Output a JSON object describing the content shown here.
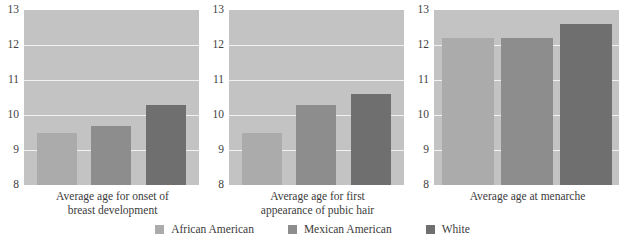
{
  "chart_data": {
    "type": "bar",
    "title": "",
    "subtitle": "",
    "xlabel": "",
    "ylabel": "",
    "ylim": [
      8,
      13
    ],
    "yticks": [
      8,
      9,
      10,
      11,
      12,
      13
    ],
    "ytick_labels": [
      "8",
      "9",
      "10",
      "11",
      "12",
      "13"
    ],
    "grid": true,
    "legend_position": "bottom-center",
    "categories": [
      "African American",
      "Mexican American",
      "White"
    ],
    "series": [
      {
        "name": "Average age for onset of breast development",
        "caption_lines": [
          "Average age for onset of",
          "breast development"
        ],
        "values": [
          9.5,
          9.7,
          10.3
        ]
      },
      {
        "name": "Average age for first appearance of pubic hair",
        "caption_lines": [
          "Average age for first",
          "appearance of pubic hair"
        ],
        "values": [
          9.5,
          10.3,
          10.6
        ]
      },
      {
        "name": "Average age at menarche",
        "caption_lines": [
          "Average age at menarche"
        ],
        "values": [
          12.2,
          12.2,
          12.6
        ]
      }
    ],
    "colors": {
      "african_american": "#ababab",
      "mexican_american": "#8d8d8d",
      "white": "#6f6f6f",
      "plot_background": "#c3c3c3",
      "gridline": "#f2f2f2",
      "page_background": "#ffffff",
      "text": "#3b3b3b"
    }
  },
  "legend": {
    "items": [
      {
        "label": "African American"
      },
      {
        "label": "Mexican American"
      },
      {
        "label": "White"
      }
    ]
  }
}
